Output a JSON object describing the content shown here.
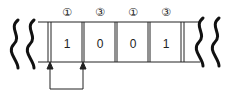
{
  "diagram": {
    "cells": [
      {
        "label": "①",
        "value": "1"
      },
      {
        "label": "③",
        "value": "0"
      },
      {
        "label": "①",
        "value": "0"
      },
      {
        "label": "③",
        "value": "1"
      }
    ],
    "colors": {
      "stroke": "#111111",
      "background": "#ffffff"
    }
  }
}
